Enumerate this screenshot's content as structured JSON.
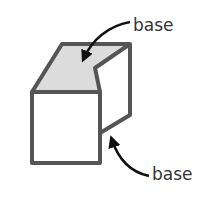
{
  "diagram": {
    "type": "figure",
    "labels": {
      "top": "base",
      "bottom": "base"
    },
    "colors": {
      "outline": "#555555",
      "top_face_fill": "#dcdcdc",
      "front_face_fill": "#ffffff",
      "arrow": "#111111",
      "text": "#333333"
    }
  }
}
